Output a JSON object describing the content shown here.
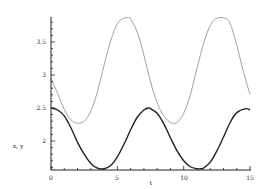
{
  "chart_data": {
    "type": "line",
    "title": "",
    "xlabel": "t",
    "ylabel": "x, y",
    "xlim": [
      0,
      15
    ],
    "ylim": [
      1.56,
      3.88
    ],
    "grid": false,
    "legend": null,
    "x_ticks": [
      0,
      5,
      10,
      15
    ],
    "x_tick_labels": [
      "0",
      "5",
      "10",
      "15"
    ],
    "y_ticks": [
      2,
      2.5,
      3,
      3.5
    ],
    "y_tick_labels": [
      "2",
      "2.5",
      "3",
      "3.5"
    ],
    "series": [
      {
        "name": "y",
        "color": "#a0a0a0",
        "x": [
          0,
          0.5,
          1,
          1.5,
          2,
          2.5,
          3,
          3.5,
          4,
          4.5,
          5,
          5.5,
          5.8,
          6,
          6.5,
          7,
          7.5,
          8,
          8.5,
          9,
          9.25,
          9.5,
          10,
          10.5,
          11,
          11.5,
          12,
          12.5,
          13.1,
          13.5,
          14,
          14.5,
          15
        ],
        "values": [
          2.95,
          2.72,
          2.48,
          2.32,
          2.27,
          2.3,
          2.45,
          2.75,
          3.15,
          3.52,
          3.78,
          3.86,
          3.87,
          3.85,
          3.65,
          3.3,
          2.9,
          2.58,
          2.38,
          2.28,
          2.27,
          2.28,
          2.42,
          2.7,
          3.1,
          3.48,
          3.75,
          3.86,
          3.86,
          3.78,
          3.45,
          3.05,
          2.7
        ]
      },
      {
        "name": "x",
        "color": "#222222",
        "x": [
          0,
          0.5,
          1,
          1.5,
          2,
          2.5,
          3,
          3.5,
          4,
          4.5,
          5,
          5.5,
          6,
          6.5,
          7,
          7.35,
          7.5,
          8,
          8.5,
          9,
          9.5,
          10,
          10.5,
          11,
          11.3,
          11.5,
          12,
          12.5,
          13,
          13.5,
          14,
          14.7,
          15
        ],
        "values": [
          2.5,
          2.47,
          2.38,
          2.2,
          1.98,
          1.8,
          1.66,
          1.59,
          1.58,
          1.63,
          1.76,
          1.95,
          2.17,
          2.36,
          2.47,
          2.5,
          2.49,
          2.42,
          2.26,
          2.05,
          1.85,
          1.7,
          1.61,
          1.58,
          1.58,
          1.59,
          1.68,
          1.85,
          2.06,
          2.28,
          2.43,
          2.49,
          2.47
        ]
      }
    ]
  },
  "axes": {
    "xlabel": "t",
    "ylabel": "x, y",
    "x_tick_labels": [
      "0",
      "5",
      "10",
      "15"
    ],
    "y_tick_labels": [
      "2",
      "2.5",
      "3",
      "3.5"
    ]
  }
}
